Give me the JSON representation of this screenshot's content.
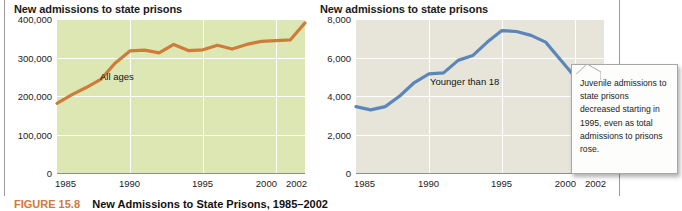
{
  "figure": {
    "caption_number": "FIGURE 15.8",
    "caption_title": "New Admissions to State Prisons, 1985–2002"
  },
  "callout": {
    "text": "Juvenile admissions to state prisons decreased starting in 1995, even as total admissions to prisons rose."
  },
  "chart_data": [
    {
      "id": "all-ages",
      "type": "line",
      "title": "New admissions to state prisons",
      "series_label": "All ages",
      "xlabel": "",
      "ylabel": "",
      "grid": true,
      "legend": "inline-annotation",
      "line_color": "#cf7b39",
      "plot_background": "#dde7b4",
      "xlim": [
        1985,
        2002
      ],
      "ylim": [
        0,
        400000
      ],
      "yticks": [
        0,
        100000,
        200000,
        300000,
        400000
      ],
      "ytick_labels": [
        "0",
        "100,000",
        "200,000",
        "300,000",
        "400,000"
      ],
      "xticks": [
        1985,
        1990,
        1995,
        2000,
        2002
      ],
      "xtick_labels": [
        "1985",
        "1990",
        "1995",
        "2000",
        "2002"
      ],
      "x": [
        1985,
        1986,
        1987,
        1988,
        1989,
        1990,
        1991,
        1992,
        1993,
        1994,
        1995,
        1996,
        1997,
        1998,
        1999,
        2000,
        2001,
        2002
      ],
      "values": [
        181000,
        203000,
        222000,
        243000,
        286000,
        317000,
        319000,
        312000,
        334000,
        318000,
        320000,
        332000,
        322000,
        334000,
        342000,
        344000,
        346000,
        390000
      ]
    },
    {
      "id": "younger-than-18",
      "type": "line",
      "title": "New admissions to state prisons",
      "series_label": "Younger than 18",
      "xlabel": "",
      "ylabel": "",
      "grid": true,
      "legend": "inline-annotation",
      "line_color": "#5b86bb",
      "plot_background": "#e7e5da",
      "xlim": [
        1985,
        2002
      ],
      "ylim": [
        0,
        8000
      ],
      "yticks": [
        0,
        2000,
        4000,
        6000,
        8000
      ],
      "ytick_labels": [
        "0",
        "2,000",
        "4,000",
        "6,000",
        "8,000"
      ],
      "xticks": [
        1985,
        1990,
        1995,
        2000,
        2002
      ],
      "xtick_labels": [
        "1985",
        "1990",
        "1995",
        "2000",
        "2002"
      ],
      "x": [
        1985,
        1986,
        1987,
        1988,
        1989,
        1990,
        1991,
        1992,
        1993,
        1994,
        1995,
        1996,
        1997,
        1998,
        1999,
        2000,
        2001,
        2002
      ],
      "values": [
        3450,
        3280,
        3450,
        4000,
        4700,
        5150,
        5200,
        5850,
        6100,
        6800,
        7400,
        7350,
        7150,
        6800,
        5900,
        5000,
        4200,
        4150
      ]
    }
  ]
}
